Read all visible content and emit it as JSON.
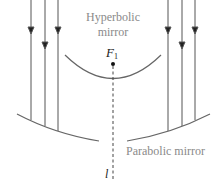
{
  "diagram": {
    "labels": {
      "hyperbolic_line1": "Hyperbolic",
      "hyperbolic_line2": "mirror",
      "focus": "F",
      "focus_sub": "1",
      "parabolic": "Parabolic mirror",
      "axis": "l"
    },
    "colors": {
      "line": "#555555",
      "label": "#8a8a8a",
      "background": "#ffffff"
    },
    "rays": {
      "left_x": [
        31,
        45,
        58
      ],
      "right_x": [
        168,
        182,
        195
      ],
      "direction": "down"
    }
  }
}
